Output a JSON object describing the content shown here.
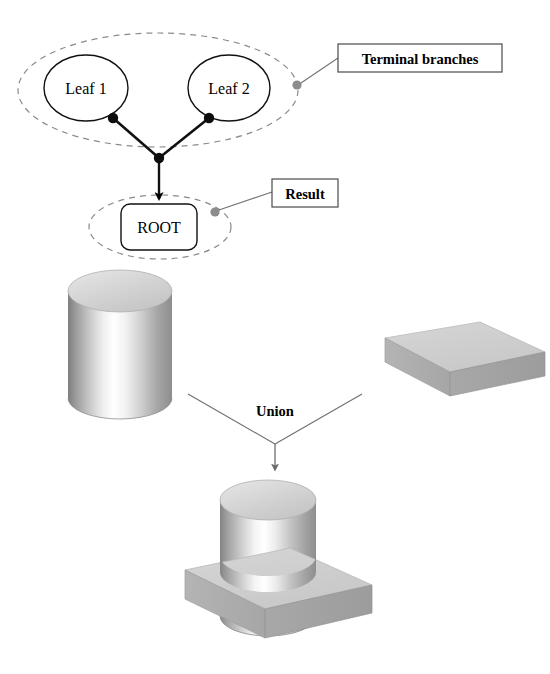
{
  "figure": {
    "background_color": "#ffffff"
  },
  "csg_tree": {
    "leaves": [
      {
        "label": "Leaf 1",
        "cx": 86,
        "cy": 88,
        "rx": 42,
        "ry": 33
      },
      {
        "label": "Leaf 2",
        "cx": 229,
        "cy": 88,
        "rx": 41,
        "ry": 33
      }
    ],
    "root": {
      "label": "ROOT",
      "x": 120,
      "y": 203,
      "w": 75,
      "h": 45
    },
    "terminal_ellipse": {
      "cx": 158,
      "cy": 90,
      "rx": 140,
      "ry": 57
    },
    "result_ellipse": {
      "cx": 160,
      "cy": 227,
      "rx": 71,
      "ry": 32
    },
    "junction": {
      "x": 159,
      "y": 158
    },
    "leaf_connectors": [
      {
        "x": 113,
        "y": 118
      },
      {
        "x": 209,
        "y": 118
      }
    ],
    "callouts": [
      {
        "label": "Terminal branches",
        "box": {
          "x": 338,
          "y": 44,
          "w": 164,
          "h": 28
        },
        "anchor": {
          "x": 297,
          "y": 85
        },
        "leader_to": {
          "x": 338,
          "y": 58
        }
      },
      {
        "label": "Result",
        "box": {
          "x": 272,
          "y": 179,
          "w": 66,
          "h": 28
        },
        "anchor": {
          "x": 215,
          "y": 211
        },
        "leader_to": {
          "x": 272,
          "y": 192
        }
      }
    ]
  },
  "operation": {
    "label": "Union",
    "label_pos": {
      "x": 275,
      "y": 412
    },
    "left_line": {
      "x1": 188,
      "y1": 394,
      "x2": 275,
      "y2": 444
    },
    "right_line": {
      "x1": 362,
      "y1": 394,
      "x2": 275,
      "y2": 444
    },
    "arrow": {
      "x1": 275,
      "y1": 444,
      "x2": 275,
      "y2": 471
    }
  },
  "solids": {
    "cylinder": {
      "name": "cylinder",
      "cx": 120,
      "top_y": 291,
      "bottom_y": 398,
      "rx": 52,
      "ry": 21
    },
    "box": {
      "name": "rectangular-slab",
      "top_face": "385,338 480,322 545,352 450,372",
      "front_face": "385,338 450,372 450,396 385,362",
      "right_face": "450,372 545,352 545,376 450,396"
    },
    "result": {
      "name": "union-result",
      "cylinder": {
        "cx": 268,
        "top_y": 500,
        "bottom_y": 600,
        "rx": 48,
        "ry": 20
      },
      "slab_top": "185,570 290,548 372,585 265,609",
      "slab_front": "185,570 265,609 265,638 185,599",
      "slab_right": "265,609 372,585 372,613 265,638"
    }
  },
  "colors": {
    "outline": "#000000",
    "dashed_ellipse": "#808080",
    "callout_dot": "#8c8c8c",
    "leader_line": "#707070",
    "text": "#000000",
    "solid_light": "#d8d8d8",
    "solid_mid": "#bdbdbd",
    "solid_dark": "#9a9a9a",
    "highlight": "#ffffff"
  }
}
